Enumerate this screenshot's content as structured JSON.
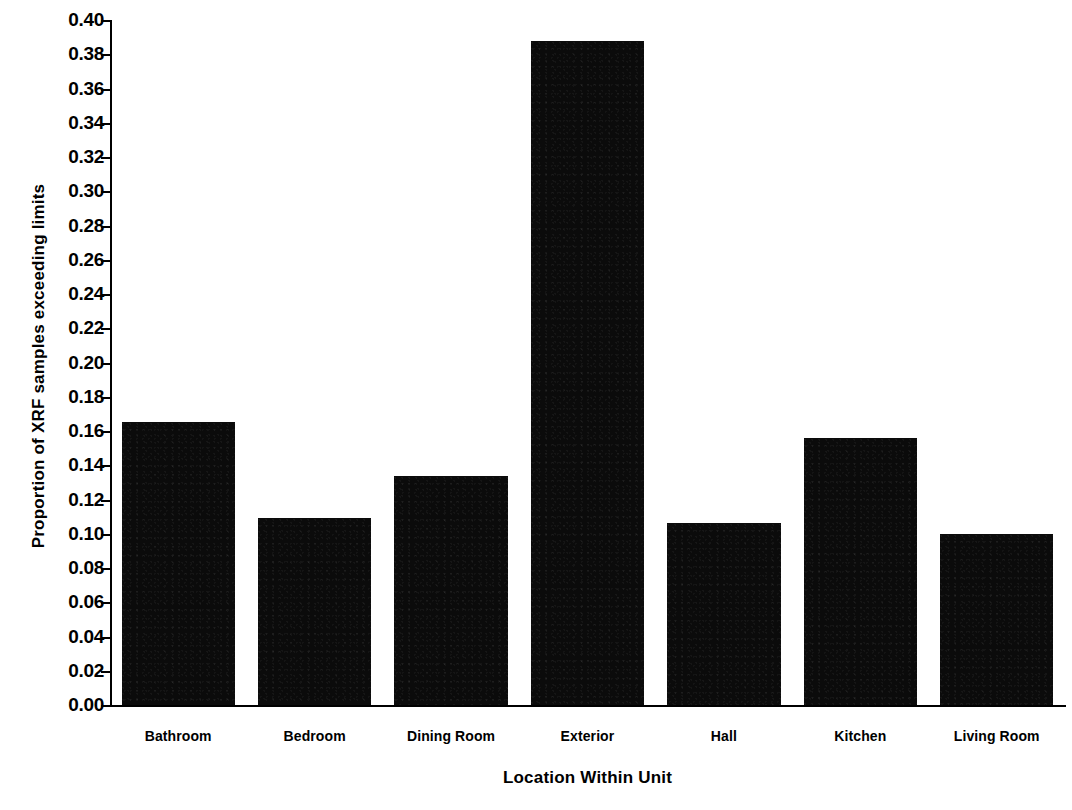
{
  "chart_data": {
    "type": "bar",
    "title": "",
    "subtitle": "",
    "xlabel": "Location Within Unit",
    "ylabel": "Proportion of XRF samples exceeding limits",
    "categories": [
      "Bathroom",
      "Bedroom",
      "Dining Room",
      "Exterior",
      "Hall",
      "Kitchen",
      "Living Room"
    ],
    "values": [
      0.165,
      0.109,
      0.134,
      0.388,
      0.106,
      0.156,
      0.1
    ],
    "ylim": [
      0.0,
      0.4
    ],
    "ytick_step": 0.02,
    "ytick_labels": [
      "0.40",
      "0.38",
      "0.36",
      "0.34",
      "0.32",
      "0.30",
      "0.28",
      "0.26",
      "0.24",
      "0.22",
      "0.20",
      "0.18",
      "0.16",
      "0.14",
      "0.12",
      "0.10",
      "0.08",
      "0.06",
      "0.04",
      "0.02",
      "0.00"
    ],
    "ytick_values": [
      0.4,
      0.38,
      0.36,
      0.34,
      0.32,
      0.3,
      0.28,
      0.26,
      0.24,
      0.22,
      0.2,
      0.18,
      0.16,
      0.14,
      0.12,
      0.1,
      0.08,
      0.06,
      0.04,
      0.02,
      0.0
    ],
    "grid": false,
    "legend": null,
    "legend_position": "none",
    "bar_color": "#000000",
    "background_color": "#ffffff",
    "axis_color": "#000000"
  }
}
